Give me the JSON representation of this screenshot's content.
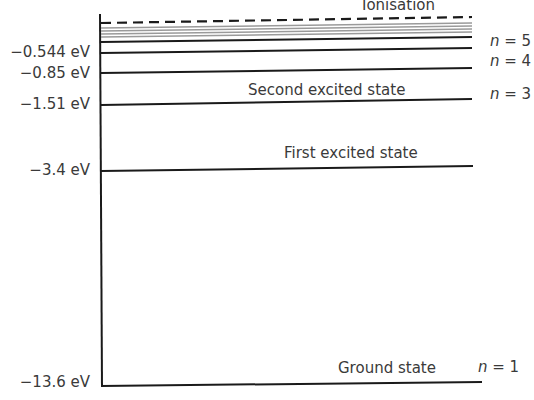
{
  "diagram": {
    "ionisation_label": "Ionisation",
    "levels": [
      {
        "n": "5",
        "energy_label": "−0.544 eV",
        "n_label_prefix": "n",
        "n_label_suffix": " = 5"
      },
      {
        "n": "4",
        "energy_label": "−0.85 eV",
        "n_label_prefix": "n",
        "n_label_suffix": " = 4"
      },
      {
        "n": "3",
        "energy_label": "−1.51 eV",
        "n_label_prefix": "n",
        "n_label_suffix": " = 3",
        "state_label": "Second excited state"
      },
      {
        "n": "2",
        "energy_label": "−3.4 eV",
        "state_label": "First excited state"
      },
      {
        "n": "1",
        "energy_label": "−13.6 eV",
        "n_label_prefix": "n",
        "n_label_suffix": " = 1",
        "state_label": "Ground state"
      }
    ],
    "colors": {
      "line": "#1a1a1a",
      "grey_lines": "#9a9a9a",
      "text": "#3a3a3a"
    }
  }
}
